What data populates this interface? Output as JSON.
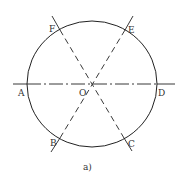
{
  "figure": {
    "caption": "a)",
    "colors": {
      "stroke": "#222222",
      "text": "#333333",
      "background": "#ffffff"
    },
    "circle": {
      "cx": 92,
      "cy": 84,
      "rx": 65,
      "ry": 63
    },
    "center_label": "O",
    "points": [
      {
        "label": "A",
        "x": 27,
        "y": 84
      },
      {
        "label": "B",
        "x": 59,
        "y": 138
      },
      {
        "label": "C",
        "x": 125,
        "y": 138
      },
      {
        "label": "D",
        "x": 157,
        "y": 84
      },
      {
        "label": "E",
        "x": 125,
        "y": 29
      },
      {
        "label": "F",
        "x": 59,
        "y": 29
      }
    ],
    "lines": [
      {
        "name": "horizontal-diameter-AD",
        "style": "dash-dot"
      },
      {
        "name": "diagonal-FC",
        "style": "dashed"
      },
      {
        "name": "diagonal-EB",
        "style": "dashed"
      }
    ],
    "labels": {
      "A": "A",
      "B": "B",
      "C": "C",
      "D": "D",
      "E": "E",
      "F": "F",
      "O": "O"
    }
  }
}
